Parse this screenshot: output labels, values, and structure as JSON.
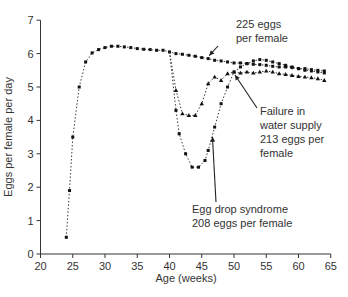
{
  "chart_data": {
    "type": "line",
    "title": "",
    "xlabel": "Age (weeks)",
    "ylabel": "Eggs per female per day",
    "xlim": [
      20,
      65
    ],
    "ylim": [
      0,
      7
    ],
    "xticks": [
      20,
      25,
      30,
      35,
      40,
      45,
      50,
      55,
      60,
      65
    ],
    "yticks": [
      0,
      1,
      2,
      3,
      4,
      5,
      6,
      7
    ],
    "grid": false,
    "legend": null,
    "series": [
      {
        "name": "Normal (225 eggs per female)",
        "marker": "circle",
        "x": [
          24,
          24.5,
          25,
          26,
          27,
          28,
          29,
          30,
          31,
          32,
          33,
          34,
          35,
          36,
          37,
          38,
          39,
          40,
          41,
          42,
          43,
          44,
          45,
          46,
          47,
          48,
          49,
          50,
          51,
          52,
          53,
          54,
          55,
          56,
          57,
          58,
          59,
          60,
          61,
          62,
          63,
          64
        ],
        "y": [
          0.5,
          1.9,
          3.5,
          5.0,
          5.75,
          6.02,
          6.12,
          6.18,
          6.22,
          6.22,
          6.2,
          6.18,
          6.15,
          6.13,
          6.12,
          6.1,
          6.1,
          6.05,
          6.0,
          5.98,
          5.95,
          5.92,
          5.88,
          5.85,
          5.8,
          5.78,
          5.75,
          5.72,
          5.72,
          5.7,
          5.68,
          5.67,
          5.65,
          5.62,
          5.6,
          5.6,
          5.58,
          5.55,
          5.55,
          5.52,
          5.5,
          5.48
        ]
      },
      {
        "name": "Failure in water supply (213 eggs per female)",
        "marker": "triangle",
        "x": [
          40,
          41,
          42,
          43,
          44,
          45,
          46,
          47,
          48,
          49,
          50,
          51,
          52,
          53,
          54,
          55,
          56,
          57,
          58,
          59,
          60,
          61,
          62,
          63,
          64
        ],
        "y": [
          6.05,
          4.9,
          4.2,
          4.15,
          4.15,
          4.5,
          5.1,
          5.3,
          5.2,
          5.4,
          5.45,
          5.42,
          5.45,
          5.42,
          5.45,
          5.48,
          5.45,
          5.4,
          5.38,
          5.35,
          5.32,
          5.3,
          5.28,
          5.25,
          5.2
        ]
      },
      {
        "name": "Egg drop syndrome (208 eggs per female)",
        "marker": "circle",
        "x": [
          40,
          41,
          41.5,
          42.5,
          43.5,
          44.5,
          45.5,
          46,
          47,
          48,
          49,
          50,
          51,
          52,
          53,
          54,
          55,
          56,
          57,
          58,
          59,
          60,
          61,
          62,
          63,
          64
        ],
        "y": [
          6.05,
          4.3,
          3.6,
          3.0,
          2.6,
          2.6,
          2.8,
          3.1,
          3.8,
          4.5,
          5.0,
          5.45,
          5.6,
          5.7,
          5.78,
          5.82,
          5.8,
          5.75,
          5.7,
          5.65,
          5.6,
          5.55,
          5.5,
          5.48,
          5.45,
          5.42
        ]
      }
    ],
    "annotations": [
      {
        "lines": [
          "225 eggs",
          "per female"
        ],
        "arrow_to": [
          46,
          5.85
        ]
      },
      {
        "lines": [
          "Failure in",
          "water supply",
          "213 eggs per",
          "female"
        ],
        "arrow_to": [
          50,
          5.45
        ]
      },
      {
        "lines": [
          "Egg drop syndrome",
          "208 eggs per female"
        ],
        "arrow_to": [
          46.5,
          3.6
        ]
      }
    ]
  }
}
